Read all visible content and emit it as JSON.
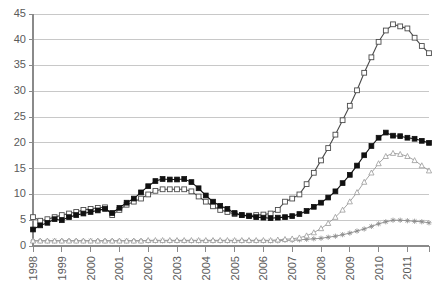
{
  "chart_data": {
    "type": "line",
    "title": "",
    "xlabel": "",
    "ylabel": "",
    "ylim": [
      0,
      45
    ],
    "ytick_step": 5,
    "yticks": [
      "0",
      "5",
      "10",
      "15",
      "20",
      "25",
      "30",
      "35",
      "40",
      "45"
    ],
    "grid": true,
    "legend_position": "none",
    "x_tick_labels": [
      "1998",
      "1999",
      "2000",
      "2001",
      "2002",
      "2003",
      "2004",
      "2005",
      "2006",
      "2007",
      "2008",
      "2009",
      "2010",
      "2011"
    ],
    "x_note": "Quarterly observations, 1998Q1 through 2011Q4; major ticks mark each year",
    "x": [
      "1998Q1",
      "1998Q2",
      "1998Q3",
      "1998Q4",
      "1999Q1",
      "1999Q2",
      "1999Q3",
      "1999Q4",
      "2000Q1",
      "2000Q2",
      "2000Q3",
      "2000Q4",
      "2001Q1",
      "2001Q2",
      "2001Q3",
      "2001Q4",
      "2002Q1",
      "2002Q2",
      "2002Q3",
      "2002Q4",
      "2003Q1",
      "2003Q2",
      "2003Q3",
      "2003Q4",
      "2004Q1",
      "2004Q2",
      "2004Q3",
      "2004Q4",
      "2005Q1",
      "2005Q2",
      "2005Q3",
      "2005Q4",
      "2006Q1",
      "2006Q2",
      "2006Q3",
      "2006Q4",
      "2007Q1",
      "2007Q2",
      "2007Q3",
      "2007Q4",
      "2008Q1",
      "2008Q2",
      "2008Q3",
      "2008Q4",
      "2009Q1",
      "2009Q2",
      "2009Q3",
      "2009Q4",
      "2010Q1",
      "2010Q2",
      "2010Q3",
      "2010Q4",
      "2011Q1",
      "2011Q2",
      "2011Q3",
      "2011Q4"
    ],
    "series": [
      {
        "name": "series-open-square",
        "marker": "open-square",
        "color": "#4a4a4a",
        "marker_fill": "#ffffff",
        "values": [
          5.6,
          4.9,
          5.2,
          5.6,
          6.0,
          6.3,
          6.6,
          7.0,
          7.2,
          7.4,
          7.5,
          6.0,
          7.0,
          8.0,
          8.6,
          9.2,
          10.0,
          10.7,
          11.0,
          11.0,
          11.0,
          11.0,
          10.6,
          9.6,
          8.6,
          7.7,
          7.0,
          6.6,
          6.2,
          6.0,
          5.9,
          6.0,
          6.1,
          6.3,
          7.0,
          8.6,
          9.2,
          10.0,
          12.0,
          14.2,
          16.6,
          19.0,
          21.6,
          24.4,
          27.2,
          30.2,
          33.6,
          36.6,
          39.6,
          41.8,
          43.0,
          42.6,
          42.2,
          40.4,
          38.8,
          37.4
        ],
        "final_value": 34.2,
        "peak_value": 43.0,
        "peak_at": "2010Q3"
      },
      {
        "name": "series-filled-square",
        "marker": "filled-square",
        "color": "#111111",
        "marker_fill": "#111111",
        "values": [
          3.2,
          4.0,
          4.5,
          5.2,
          5.0,
          5.6,
          6.0,
          6.3,
          6.6,
          6.9,
          7.2,
          6.4,
          7.4,
          8.4,
          9.2,
          10.4,
          11.6,
          12.6,
          13.0,
          12.9,
          12.9,
          13.0,
          12.4,
          11.2,
          9.8,
          8.6,
          7.8,
          7.2,
          6.4,
          6.0,
          5.8,
          5.6,
          5.5,
          5.4,
          5.5,
          5.6,
          5.8,
          6.2,
          6.8,
          7.6,
          8.4,
          9.4,
          10.6,
          12.2,
          13.8,
          15.6,
          17.6,
          19.4,
          21.0,
          22.0,
          21.4,
          21.3,
          21.0,
          20.8,
          20.4,
          20.0
        ],
        "final_value": 19.0,
        "peak_value": 22.0,
        "peak_at": "2010Q2"
      },
      {
        "name": "series-open-triangle",
        "marker": "open-triangle",
        "color": "#9a9a9a",
        "marker_fill": "#ffffff",
        "values": [
          1.0,
          1.0,
          1.0,
          1.0,
          1.0,
          1.0,
          1.0,
          1.0,
          1.0,
          1.0,
          1.0,
          1.0,
          1.0,
          1.0,
          1.0,
          1.0,
          1.1,
          1.1,
          1.1,
          1.1,
          1.1,
          1.1,
          1.1,
          1.1,
          1.1,
          1.1,
          1.1,
          1.1,
          1.1,
          1.1,
          1.1,
          1.1,
          1.1,
          1.1,
          1.2,
          1.3,
          1.4,
          1.6,
          2.0,
          2.6,
          3.4,
          4.4,
          5.6,
          7.0,
          8.6,
          10.4,
          12.4,
          14.2,
          16.0,
          17.4,
          18.0,
          17.8,
          17.4,
          16.6,
          15.6,
          14.6
        ],
        "final_value": 13.0,
        "peak_value": 18.0,
        "peak_at": "2010Q3"
      },
      {
        "name": "series-star",
        "marker": "star",
        "color": "#8a8a8a",
        "marker_fill": "#8a8a8a",
        "values": [
          1.0,
          1.0,
          1.0,
          1.0,
          1.0,
          1.0,
          1.0,
          1.0,
          1.0,
          1.0,
          1.0,
          1.0,
          1.0,
          1.0,
          1.0,
          1.0,
          1.0,
          1.0,
          1.0,
          1.0,
          1.0,
          1.0,
          1.0,
          1.0,
          1.0,
          1.0,
          1.0,
          1.0,
          1.0,
          1.0,
          1.0,
          1.0,
          1.0,
          1.0,
          1.0,
          1.1,
          1.1,
          1.2,
          1.3,
          1.4,
          1.5,
          1.7,
          1.9,
          2.2,
          2.5,
          2.9,
          3.3,
          3.8,
          4.3,
          4.7,
          5.0,
          5.0,
          4.9,
          4.8,
          4.7,
          4.5
        ],
        "final_value": 4.3,
        "peak_value": 5.0,
        "peak_at": "2010Q3"
      }
    ]
  },
  "axis_style": {
    "axis_color": "#8a8a8a",
    "grid_color": "#c8c8c8",
    "label_color": "#5a5a5a"
  }
}
